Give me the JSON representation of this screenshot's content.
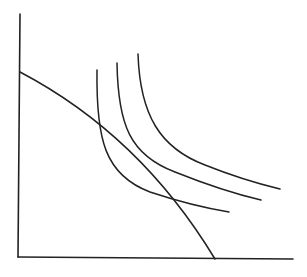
{
  "diagram": {
    "type": "indifference-curves-with-budget-line",
    "background": "#ffffff",
    "stroke_color": "#222222",
    "axes": {
      "y_axis": {
        "x1": 20,
        "y1": 14,
        "x2": 18,
        "y2": 257
      },
      "x_axis": {
        "x1": 18,
        "y1": 257,
        "x2": 293,
        "y2": 259
      }
    },
    "budget_line": {
      "d": "M20,72 Q140,135 215,259"
    },
    "indifference_curves": [
      {
        "name": "inner",
        "d": "M97,70 C96,140 105,175 150,192 C180,202 205,208 229,212"
      },
      {
        "name": "middle",
        "d": "M117,63 C118,125 130,155 175,172 C205,184 235,194 261,200"
      },
      {
        "name": "outer",
        "d": "M138,54 C140,115 160,148 205,165 C230,175 255,183 280,189"
      }
    ]
  }
}
